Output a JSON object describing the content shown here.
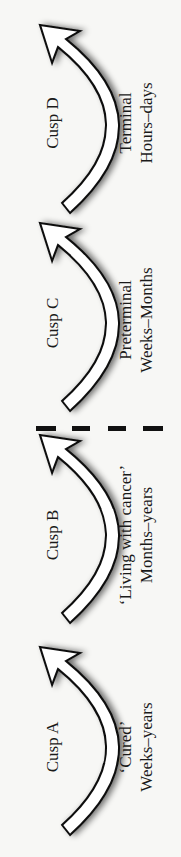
{
  "diagram": {
    "orientation": "rotated-90-ccw",
    "divider": {
      "style": "dashed",
      "color": "#111111",
      "position": "between Cusp B and Cusp C"
    },
    "stages": [
      {
        "cusp": "Cusp A",
        "label": "‘Cured’",
        "duration": "Weeks–years"
      },
      {
        "cusp": "Cusp B",
        "label": "‘Living with cancer’",
        "duration": "Months–years"
      },
      {
        "cusp": "Cusp C",
        "label": "Preterminal",
        "duration": "Weeks–Months"
      },
      {
        "cusp": "Cusp D",
        "label": "Terminal",
        "duration": "Hours–days"
      }
    ]
  }
}
